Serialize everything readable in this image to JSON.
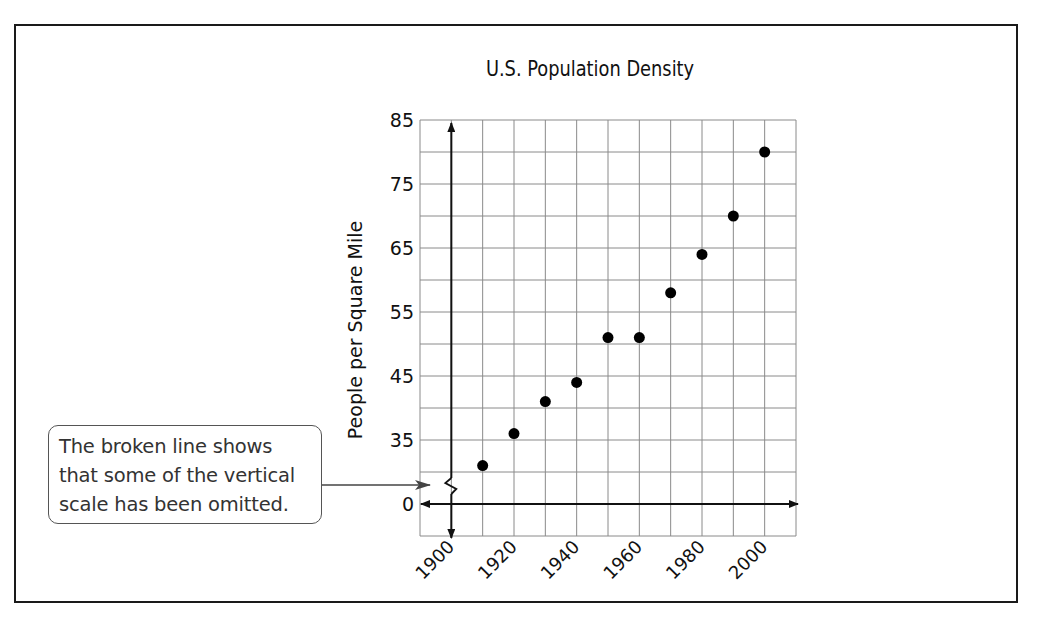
{
  "chart_data": {
    "type": "scatter",
    "title": "U.S. Population Density",
    "xlabel": "",
    "ylabel": "People per Square Mile",
    "x_tick_labels": [
      "1900",
      "1920",
      "1940",
      "1960",
      "1980",
      "2000"
    ],
    "y_tick_labels": [
      "0",
      "35",
      "45",
      "55",
      "65",
      "75",
      "85"
    ],
    "y_axis_break": true,
    "grid": true,
    "legend": null,
    "x": [
      1910,
      1920,
      1930,
      1940,
      1950,
      1960,
      1970,
      1980,
      1990,
      2000
    ],
    "values": [
      31,
      36,
      41,
      44,
      51,
      51,
      58,
      64,
      70,
      80
    ],
    "xlim": [
      1890,
      2010
    ],
    "ylim_displayed": [
      25,
      85
    ],
    "annotations": [
      {
        "text": "The broken line shows that some of the vertical scale has been omitted.",
        "points_to": "y-axis break between 0 and 30"
      }
    ]
  },
  "title": "U.S. Population Density",
  "ylabel": "People per Square Mile",
  "callout": {
    "lines": [
      "The broken line shows",
      "that some of the vertical",
      "scale has been omitted."
    ]
  },
  "colors": {
    "grid": "#8a8a8a",
    "axis": "#111111",
    "point": "#000000",
    "frame": "#1a1a1a"
  }
}
